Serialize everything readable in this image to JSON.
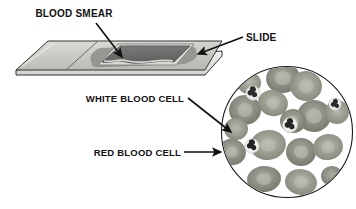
{
  "figure": {
    "type": "biology-diagram",
    "background_color": "#ffffff",
    "text_color": "#111111"
  },
  "labels": [
    {
      "id": "blood-smear",
      "text": "BLOOD SMEAR",
      "x": 74,
      "y": 17,
      "anchor": "middle"
    },
    {
      "id": "slide",
      "text": "SLIDE",
      "x": 246,
      "y": 41,
      "anchor": "start"
    },
    {
      "id": "white-blood-cell",
      "text": "WHITE BLOOD CELL",
      "x": 184,
      "y": 102,
      "anchor": "end"
    },
    {
      "id": "red-blood-cell",
      "text": "RED BLOOD CELL",
      "x": 181,
      "y": 156,
      "anchor": "end"
    }
  ],
  "leader_lines": [
    {
      "id": "leader-blood-smear",
      "from": [
        96,
        22
      ],
      "to": [
        122,
        58
      ],
      "arrow": true
    },
    {
      "id": "leader-slide",
      "from": [
        243,
        38
      ],
      "to": [
        196,
        55
      ],
      "arrow": true
    },
    {
      "id": "leader-white-blood-cell",
      "from": [
        188,
        98
      ],
      "to": [
        232,
        133
      ],
      "arrow": true
    },
    {
      "id": "leader-red-blood-cell",
      "from": [
        184,
        152
      ],
      "to": [
        222,
        152
      ],
      "arrow": true
    }
  ],
  "slide": {
    "id": "glass-slide",
    "description": "rectangular glass microscope slide drawn in perspective",
    "face_color": "#cfcfcb",
    "edge_color": "#3a3a3a",
    "side_color": "#efefec",
    "smear": {
      "id": "blood-smear-patch",
      "description": "dark grey blood smear film spread across slide",
      "color": "#6f6f6f",
      "halo_color": "#8f8f8f"
    },
    "coverslip": {
      "id": "coverslip",
      "color": "#d8d8d2"
    }
  },
  "microscope_view": {
    "id": "microscope-field",
    "center": [
      287,
      132
    ],
    "radius": 66,
    "ring_color": "#1a1a1a",
    "field_color": "#ffffff",
    "red_blood_cells": {
      "count": 16,
      "fill": "#8a8a80",
      "fill_light": "#a7a79c",
      "center_highlight": "#b9b9ae",
      "cells": [
        {
          "cx": 283,
          "cy": 78,
          "rx": 17,
          "ry": 15,
          "rot": -12
        },
        {
          "cx": 305,
          "cy": 85,
          "rx": 16,
          "ry": 15,
          "rot": 10
        },
        {
          "cx": 245,
          "cy": 108,
          "rx": 16,
          "ry": 15,
          "rot": 0
        },
        {
          "cx": 273,
          "cy": 103,
          "rx": 15,
          "ry": 13,
          "rot": 15
        },
        {
          "cx": 313,
          "cy": 115,
          "rx": 17,
          "ry": 16,
          "rot": -5
        },
        {
          "cx": 229,
          "cy": 151,
          "rx": 14,
          "ry": 13,
          "rot": 20
        },
        {
          "cx": 268,
          "cy": 144,
          "rx": 18,
          "ry": 15,
          "rot": -8
        },
        {
          "cx": 300,
          "cy": 151,
          "rx": 15,
          "ry": 14,
          "rot": 5
        },
        {
          "cx": 327,
          "cy": 147,
          "rx": 15,
          "ry": 13,
          "rot": -10
        },
        {
          "cx": 264,
          "cy": 178,
          "rx": 17,
          "ry": 13,
          "rot": -6
        },
        {
          "cx": 300,
          "cy": 181,
          "rx": 16,
          "ry": 13,
          "rot": 8
        },
        {
          "cx": 335,
          "cy": 112,
          "rx": 12,
          "ry": 12,
          "rot": 0
        },
        {
          "cx": 249,
          "cy": 82,
          "rx": 12,
          "ry": 11,
          "rot": 0
        },
        {
          "cx": 330,
          "cy": 175,
          "rx": 11,
          "ry": 10,
          "rot": 0
        },
        {
          "cx": 237,
          "cy": 128,
          "rx": 12,
          "ry": 11,
          "rot": 0
        },
        {
          "cx": 292,
          "cy": 120,
          "rx": 13,
          "ry": 12,
          "rot": 0
        }
      ]
    },
    "white_blood_cells": {
      "count": 4,
      "cytoplasm": "#e8e8e4",
      "nucleus": "#2b2b2b",
      "cells": [
        {
          "cx": 253,
          "cy": 93,
          "r": 7
        },
        {
          "cx": 290,
          "cy": 125,
          "r": 7
        },
        {
          "cx": 334,
          "cy": 104,
          "r": 6
        },
        {
          "cx": 252,
          "cy": 146,
          "r": 7
        }
      ]
    }
  }
}
